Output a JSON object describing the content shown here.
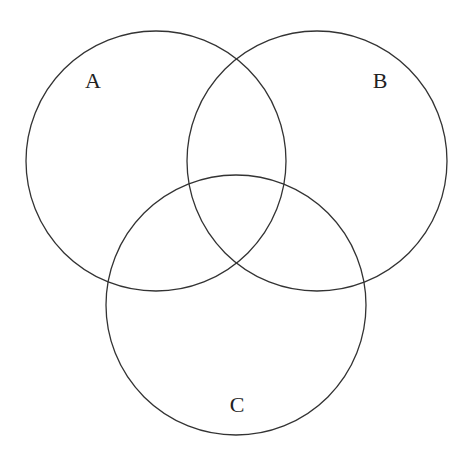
{
  "diagram": {
    "type": "venn",
    "sets": [
      {
        "label": "A",
        "cx": 156,
        "cy": 161,
        "r": 130,
        "label_x": 93,
        "label_y": 88
      },
      {
        "label": "B",
        "cx": 317,
        "cy": 161,
        "r": 130,
        "label_x": 380,
        "label_y": 88
      },
      {
        "label": "C",
        "cx": 236,
        "cy": 305,
        "r": 130,
        "label_x": 237,
        "label_y": 412
      }
    ],
    "stroke_color": "#333333",
    "background": "#ffffff"
  }
}
